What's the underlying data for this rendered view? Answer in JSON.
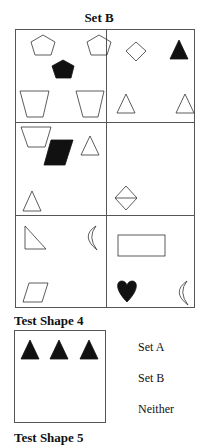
{
  "set_title": "Set B",
  "set_cells": [
    {
      "row": 1,
      "col": 1,
      "shapes": [
        "outline-pentagon",
        "outline-pentagon",
        "filled-pentagon",
        "outline-trapezoid",
        "outline-trapezoid"
      ]
    },
    {
      "row": 1,
      "col": 2,
      "shapes": [
        "outline-diamond",
        "filled-triangle",
        "outline-triangle",
        "outline-triangle"
      ]
    },
    {
      "row": 2,
      "col": 1,
      "shapes": [
        "outline-trapezoid",
        "outline-triangle",
        "filled-parallelogram",
        "outline-triangle"
      ]
    },
    {
      "row": 2,
      "col": 2,
      "shapes": [
        "outline-diamond-with-line"
      ]
    },
    {
      "row": 3,
      "col": 1,
      "shapes": [
        "outline-right-triangle",
        "outline-crescent",
        "outline-parallelogram"
      ]
    },
    {
      "row": 3,
      "col": 2,
      "shapes": [
        "outline-rectangle",
        "filled-heart",
        "outline-crescent"
      ]
    }
  ],
  "test": {
    "title": "Test Shape 4",
    "shapes": [
      "filled-triangle",
      "filled-triangle",
      "filled-triangle"
    ],
    "options": [
      "Set A",
      "Set B",
      "Neither"
    ]
  },
  "next_title": "Test Shape 5"
}
